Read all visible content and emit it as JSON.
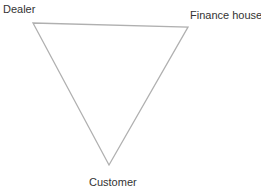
{
  "diagram": {
    "type": "triangle-relationship",
    "nodes": [
      {
        "id": "dealer",
        "label": "Dealer",
        "position": "top-left"
      },
      {
        "id": "finance_house",
        "label": "Finance house",
        "position": "top-right"
      },
      {
        "id": "customer",
        "label": "Customer",
        "position": "bottom"
      }
    ],
    "edges": [
      {
        "from": "dealer",
        "to": "finance_house"
      },
      {
        "from": "finance_house",
        "to": "customer"
      },
      {
        "from": "customer",
        "to": "dealer"
      }
    ],
    "line_color": "#b0b0b0",
    "text_color": "#333333"
  }
}
